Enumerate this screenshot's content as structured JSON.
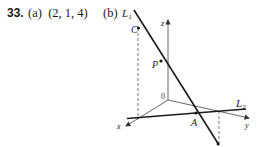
{
  "problem": {
    "number": "33.",
    "part_a": {
      "label": "(a)",
      "answer": "(2, 1, 4)"
    },
    "part_b": {
      "label": "(b)"
    }
  },
  "figure": {
    "axes": {
      "x": "x",
      "y": "y",
      "z": "z",
      "origin": "0"
    },
    "lines": {
      "L1": "L",
      "L1_sub": "1",
      "L2": "L",
      "L2_sub": "2"
    },
    "points": {
      "C": "C",
      "P": "P",
      "A": "A"
    }
  }
}
